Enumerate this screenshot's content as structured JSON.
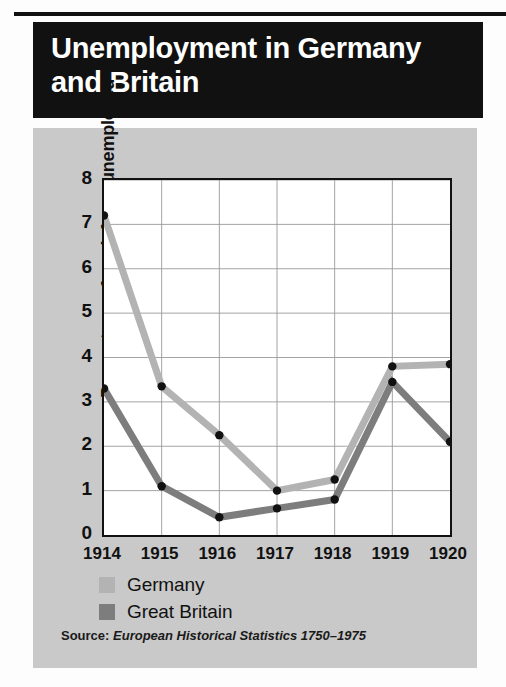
{
  "figure": {
    "title": "Unemployment in Germany\nand Britain",
    "panel_bg": "#c9c9c9",
    "plot_bg": "#ffffff",
    "banner_bg": "#111111",
    "banner_fg": "#ffffff"
  },
  "source": {
    "prefix": "Source: ",
    "title": "European Historical Statistics 1750–1975"
  },
  "legend": {
    "position": "below-axis",
    "entries": [
      {
        "label": "Germany",
        "color": "#b3b3b3"
      },
      {
        "label": "Great Britain",
        "color": "#7d7d7d"
      }
    ]
  },
  "chart_data": {
    "type": "line",
    "title": "Unemployment in Germany and Britain",
    "xlabel": "",
    "ylabel": "Percentage of work force unemployed",
    "x": [
      "1914",
      "1915",
      "1916",
      "1917",
      "1918",
      "1919",
      "1920"
    ],
    "categories": [
      "1914",
      "1915",
      "1916",
      "1917",
      "1918",
      "1919",
      "1920"
    ],
    "xtick_labels": [
      "1914",
      "1915",
      "1916",
      "1917",
      "1918",
      "1919",
      "1920"
    ],
    "ytick_labels": [
      "0",
      "1",
      "2",
      "3",
      "4",
      "5",
      "6",
      "7",
      "8"
    ],
    "yticks": [
      0,
      1,
      2,
      3,
      4,
      5,
      6,
      7,
      8
    ],
    "ylim": [
      0,
      8
    ],
    "grid": true,
    "grid_axis": "both",
    "markers": true,
    "series": [
      {
        "name": "Germany",
        "color": "#b3b3b3",
        "values": [
          7.2,
          3.35,
          2.25,
          1.0,
          1.25,
          3.8,
          3.85
        ]
      },
      {
        "name": "Great Britain",
        "color": "#7d7d7d",
        "values": [
          3.3,
          1.1,
          0.4,
          0.6,
          0.8,
          3.45,
          2.1
        ]
      }
    ]
  }
}
